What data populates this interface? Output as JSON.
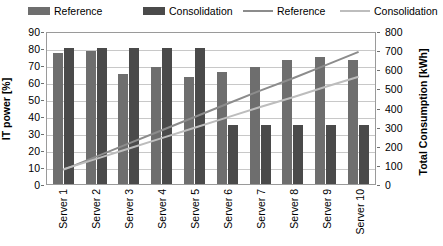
{
  "chart_data": {
    "type": "bar",
    "title": "",
    "xlabel": "",
    "ylabel": "IT power [%]",
    "y2label": "Total Consumption [kWh]",
    "categories": [
      "Server 1",
      "Server 2",
      "Server 3",
      "Server 4",
      "Server 5",
      "Server 6",
      "Server 7",
      "Server 8",
      "Server 9",
      "Server 10"
    ],
    "ylim": [
      0,
      90
    ],
    "y2lim": [
      0,
      800
    ],
    "yticks": [
      0,
      10,
      20,
      30,
      40,
      50,
      60,
      70,
      80,
      90
    ],
    "y2ticks": [
      0,
      100,
      200,
      300,
      400,
      500,
      600,
      700,
      800
    ],
    "grid": true,
    "legend_position": "top",
    "series": [
      {
        "name": "Reference",
        "kind": "bar",
        "axis": "left",
        "color": "#6e6e6e",
        "values": [
          77,
          78,
          65,
          69,
          63,
          66,
          69,
          73,
          75,
          73
        ]
      },
      {
        "name": "Consolidation",
        "kind": "bar",
        "axis": "left",
        "color": "#4a4a4a",
        "values": [
          80,
          80,
          80,
          80,
          80,
          35,
          35,
          35,
          35,
          35
        ]
      },
      {
        "name": "Reference",
        "kind": "line",
        "axis": "right",
        "color": "#8c8c8c",
        "values": [
          75,
          145,
          215,
          285,
          355,
          425,
          495,
          560,
          630,
          700
        ]
      },
      {
        "name": "Consolidation",
        "kind": "line",
        "axis": "right",
        "color": "#bdbdbd",
        "values": [
          78,
          133,
          188,
          243,
          298,
          353,
          408,
          460,
          515,
          568
        ]
      }
    ]
  },
  "legend": {
    "items": [
      {
        "label": "Reference",
        "marker": "bar",
        "color": "#6e6e6e"
      },
      {
        "label": "Consolidation",
        "marker": "bar",
        "color": "#4a4a4a"
      },
      {
        "label": "Reference",
        "marker": "line",
        "color": "#8c8c8c"
      },
      {
        "label": "Consolidation",
        "marker": "line",
        "color": "#bdbdbd"
      }
    ]
  }
}
